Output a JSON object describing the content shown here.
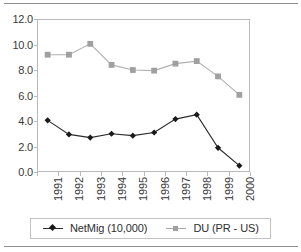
{
  "chart_data": {
    "type": "line",
    "title": "",
    "xlabel": "",
    "ylabel": "",
    "categories": [
      "1991",
      "1992",
      "1993",
      "1994",
      "1995",
      "1996",
      "1997",
      "1998",
      "1999",
      "2000"
    ],
    "series": [
      {
        "name": "NetMig (10,000)",
        "marker": "diamond",
        "color": "#1a1a1a",
        "line_color": "#2b2b2b",
        "values": [
          4.05,
          2.95,
          2.7,
          3.0,
          2.85,
          3.1,
          4.15,
          4.5,
          1.9,
          0.5
        ]
      },
      {
        "name": "DU (PR - US)",
        "marker": "square",
        "color": "#a0a0a0",
        "line_color": "#b0b0b0",
        "values": [
          9.2,
          9.2,
          10.05,
          8.4,
          8.0,
          7.95,
          8.5,
          8.7,
          7.5,
          6.05
        ]
      }
    ],
    "ylim": [
      0.0,
      12.0
    ],
    "ytick_labels": [
      "12.0",
      "10.0",
      "8.0",
      "6.0",
      "4.0",
      "2.0",
      "0.0"
    ],
    "ytick_values": [
      12.0,
      10.0,
      8.0,
      6.0,
      4.0,
      2.0,
      0.0
    ],
    "grid": false,
    "legend_position": "bottom",
    "plot_border_color": "#b9b9b9",
    "background_color": "#ffffff"
  },
  "legend": {
    "entries": [
      {
        "label": "NetMig (10,000)"
      },
      {
        "label": "DU (PR - US)"
      }
    ]
  }
}
